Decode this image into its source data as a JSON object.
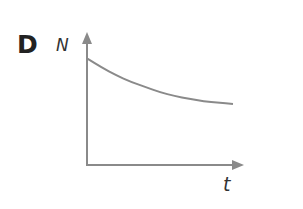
{
  "panel_label": "D",
  "chart_data": {
    "type": "line",
    "title": "",
    "xlabel": "t",
    "ylabel": "N",
    "grid": false,
    "legend": null,
    "x": [
      0,
      0.1,
      0.2,
      0.3,
      0.4,
      0.5,
      0.6,
      0.7,
      0.8,
      0.9,
      1.0
    ],
    "series": [
      {
        "name": "N(t)",
        "description": "decreasing curve approaching a non-zero asymptote (exponential-like decay)",
        "values": [
          0.82,
          0.75,
          0.69,
          0.64,
          0.6,
          0.56,
          0.53,
          0.51,
          0.49,
          0.48,
          0.47
        ]
      }
    ],
    "ylim": [
      0,
      1
    ],
    "xlim": [
      0,
      1.1
    ],
    "axis_color": "#8a8a8a",
    "line_color": "#8a8a8a"
  }
}
